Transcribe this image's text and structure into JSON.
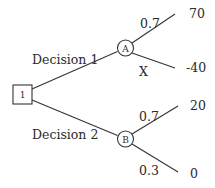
{
  "diagram": {
    "type": "decision-tree",
    "root": {
      "label": "1",
      "shape": "square"
    },
    "branches": [
      {
        "label": "Decision 1",
        "node": {
          "label": "A",
          "shape": "circle"
        },
        "outcomes": [
          {
            "probability": "0.7",
            "value": "70"
          },
          {
            "probability": "X",
            "value": "-40"
          }
        ]
      },
      {
        "label": "Decision 2",
        "node": {
          "label": "B",
          "shape": "circle"
        },
        "outcomes": [
          {
            "probability": "0.7",
            "value": "20"
          },
          {
            "probability": "0.3",
            "value": "0"
          }
        ]
      }
    ]
  },
  "colors": {
    "line": "#333333",
    "text": "#2a2a2a",
    "background": "#ffffff"
  }
}
